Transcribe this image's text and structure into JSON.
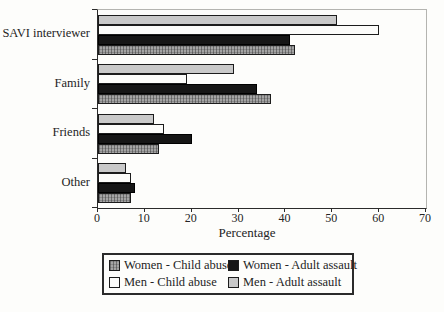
{
  "chart_data": {
    "type": "bar",
    "orientation": "horizontal",
    "title": "",
    "xlabel": "Percentage",
    "ylabel": "",
    "xlim": [
      0,
      70
    ],
    "xticks": [
      0,
      10,
      20,
      30,
      40,
      50,
      60,
      70
    ],
    "grid": false,
    "legend_position": "bottom",
    "categories": [
      "SAVI interviewer",
      "Family",
      "Friends",
      "Other"
    ],
    "series": [
      {
        "name": "Men - Adult assault",
        "key": "men_adult",
        "values": [
          51,
          29,
          12,
          6
        ]
      },
      {
        "name": "Men - Child abuse",
        "key": "men_child",
        "values": [
          60,
          19,
          14,
          7
        ]
      },
      {
        "name": "Women - Adult assault",
        "key": "women_adult",
        "values": [
          41,
          34,
          20,
          8
        ]
      },
      {
        "name": "Women - Child abuse",
        "key": "women_child",
        "values": [
          42,
          37,
          13,
          7
        ]
      }
    ],
    "legend": [
      {
        "label": "Women - Child abuse",
        "key": "women_child"
      },
      {
        "label": "Women - Adult assault",
        "key": "women_adult"
      },
      {
        "label": "Men - Child abuse",
        "key": "men_child"
      },
      {
        "label": "Men - Adult assault",
        "key": "men_adult"
      }
    ],
    "colors": {
      "men_adult_fill": "#c9c9c9",
      "men_child_fill": "#fcfcfa",
      "women_adult_fill": "#161616",
      "women_child_fill": "#a4a4a4",
      "bar_border": "#1c1c1c",
      "axis_dark": "#2b2b2b",
      "frame_light": "#b4b4b0",
      "background": "#fdfdfb"
    }
  }
}
